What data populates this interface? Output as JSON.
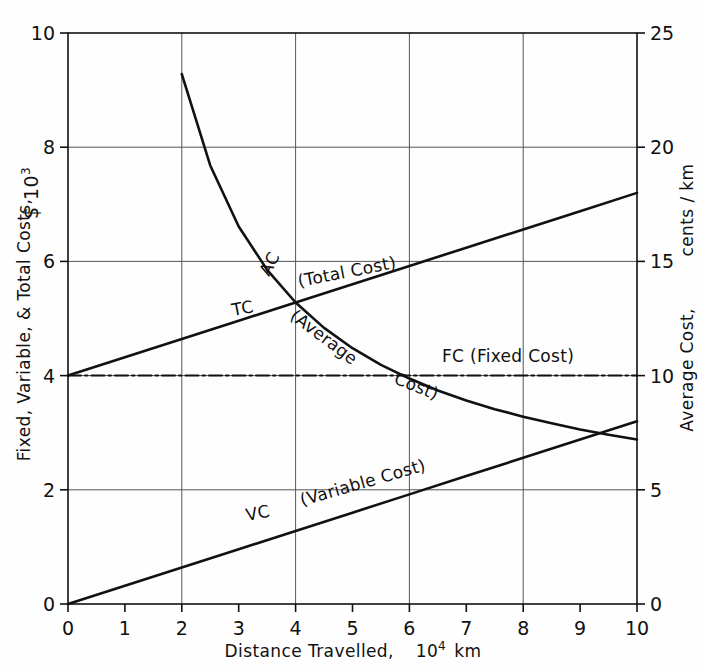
{
  "figure": {
    "background": "#fefefe",
    "ink": "#111111",
    "gridline_color": "#555555"
  },
  "axes": {
    "x": {
      "title_main": "Distance Travelled,",
      "title_unit_base": "10",
      "title_unit_exp": "4",
      "title_unit_tail": "km",
      "ticks": [
        "0",
        "1",
        "2",
        "3",
        "4",
        "5",
        "6",
        "7",
        "8",
        "9",
        "10"
      ],
      "min": 0,
      "max": 10,
      "grid_at": [
        2,
        4,
        6,
        8
      ]
    },
    "y_left": {
      "title_main": "Fixed, Variable, & Total Costs,",
      "title_unit_base": "$ 10",
      "title_unit_exp": "3",
      "ticks": [
        "0",
        "2",
        "4",
        "6",
        "8",
        "10"
      ],
      "min": 0,
      "max": 10,
      "grid_at": [
        2,
        4,
        6,
        8
      ]
    },
    "y_right": {
      "title_main": "Average Cost,",
      "title_unit_tail": "cents / km",
      "ticks": [
        "0",
        "5",
        "10",
        "15",
        "20",
        "25"
      ],
      "min": 0,
      "max": 25
    }
  },
  "curve_labels": {
    "ac_code": "AC",
    "ac_paren_1": "(Average",
    "ac_paren_2": "Cost)",
    "tc_code": "TC",
    "tc_paren": "(Total  Cost)",
    "fc_text": "FC  (Fixed Cost)",
    "vc_code": "VC",
    "vc_paren": "(Variable Cost)"
  },
  "chart_data": {
    "type": "line",
    "title": "",
    "xlabel": "Distance Travelled, 10^4 km",
    "ylabel": "Fixed, Variable, & Total Costs, $ 10^3",
    "ylabel_right": "Average Cost, cents / km",
    "xlim": [
      0,
      10
    ],
    "ylim": [
      0,
      10
    ],
    "ylim_right": [
      0,
      25
    ],
    "grid": true,
    "legend": "inline-annotations",
    "x": [
      0,
      1,
      2,
      3,
      4,
      5,
      6,
      7,
      8,
      9,
      10
    ],
    "series": [
      {
        "name": "FC (Fixed Cost)",
        "axis": "left",
        "style": "dash-dot",
        "values": [
          4.0,
          4.0,
          4.0,
          4.0,
          4.0,
          4.0,
          4.0,
          4.0,
          4.0,
          4.0,
          4.0
        ]
      },
      {
        "name": "VC (Variable Cost)",
        "axis": "left",
        "style": "solid",
        "values": [
          0.0,
          0.32,
          0.64,
          0.96,
          1.28,
          1.6,
          1.92,
          2.24,
          2.56,
          2.88,
          3.2
        ]
      },
      {
        "name": "TC (Total Cost)",
        "axis": "left",
        "style": "solid",
        "values": [
          4.0,
          4.32,
          4.64,
          4.96,
          5.28,
          5.6,
          5.92,
          6.24,
          6.56,
          6.88,
          7.2
        ]
      },
      {
        "name": "AC (Average Cost)",
        "axis": "right",
        "style": "solid",
        "x": [
          2,
          2.5,
          3,
          3.5,
          4,
          4.5,
          5,
          5.5,
          6,
          6.5,
          7,
          7.5,
          8,
          8.5,
          9,
          9.5,
          10
        ],
        "values": [
          23.2,
          19.2,
          16.53,
          14.63,
          13.2,
          12.09,
          11.2,
          10.47,
          9.87,
          9.35,
          8.91,
          8.53,
          8.2,
          7.91,
          7.64,
          7.41,
          7.2
        ]
      }
    ],
    "annotations": [
      {
        "text": "AC (Average Cost)",
        "at_x": 3.7,
        "note": "along descending AC curve"
      },
      {
        "text": "TC (Total Cost)",
        "at_x": 3.3,
        "note": "along rising TC line"
      },
      {
        "text": "FC (Fixed Cost)",
        "at_x": 7.2,
        "note": "above flat FC line"
      },
      {
        "text": "VC (Variable Cost)",
        "at_x": 4.2,
        "note": "along rising VC line"
      }
    ]
  }
}
